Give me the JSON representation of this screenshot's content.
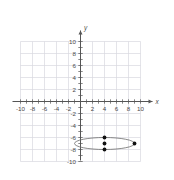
{
  "figure": {
    "title": "",
    "background_color": "#ffffff",
    "grid_color": "#d9d9e0",
    "axis_color": "#555555",
    "curve_color": "#6b6b6b",
    "point_color": "#111111",
    "tick_label_color": "#4a4a4a"
  },
  "axes": {
    "x_axis_label": "x",
    "y_axis_label": "y",
    "x_tick_labels": [
      "-10",
      "-8",
      "-6",
      "-4",
      "-2",
      "2",
      "4",
      "6",
      "8",
      "10"
    ],
    "y_tick_labels": [
      "10",
      "8",
      "6",
      "4",
      "2",
      "-2",
      "-4",
      "-6",
      "-8",
      "-10"
    ]
  },
  "chart_data": {
    "type": "scatter",
    "title": "",
    "xlabel": "x",
    "ylabel": "y",
    "xlim": [
      -11,
      11
    ],
    "ylim": [
      -11,
      11
    ],
    "xticks": [
      -10,
      -8,
      -6,
      -4,
      -2,
      2,
      4,
      6,
      8,
      10
    ],
    "yticks": [
      10,
      8,
      6,
      4,
      2,
      -2,
      -4,
      -6,
      -8,
      -10
    ],
    "grid": true,
    "grid_spacing": 2,
    "minor_ticks": 1,
    "legend": "none",
    "series": [
      {
        "name": "ellipse",
        "type": "curve",
        "shape": "ellipse",
        "center": [
          4,
          -7
        ],
        "semi_axis_x": 5,
        "semi_axis_y": 1
      },
      {
        "name": "marked-points",
        "type": "scatter",
        "points": [
          {
            "x": 4,
            "y": -6
          },
          {
            "x": 4,
            "y": -7
          },
          {
            "x": 4,
            "y": -8
          },
          {
            "x": 9,
            "y": -7
          }
        ]
      }
    ]
  }
}
